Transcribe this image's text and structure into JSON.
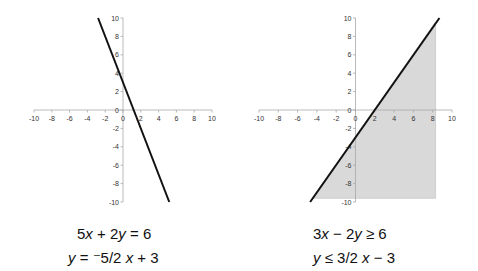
{
  "chart_data": [
    {
      "type": "line",
      "title": "",
      "xlabel": "",
      "ylabel": "",
      "xlim": [
        -10,
        10
      ],
      "ylim": [
        -10,
        10
      ],
      "x_ticks": [
        -10,
        -8,
        -6,
        -4,
        -2,
        0,
        2,
        4,
        6,
        8,
        10
      ],
      "y_ticks": [
        10,
        8,
        6,
        4,
        2,
        0,
        -2,
        -4,
        -6,
        -8,
        -10
      ],
      "grid": false,
      "legend": "none",
      "series": [
        {
          "name": "5x + 2y = 6",
          "x": [
            -2.8,
            5.2
          ],
          "y": [
            10,
            -10
          ],
          "color": "#111111"
        }
      ],
      "equation": "5x + 2y = 6",
      "slope_intercept": "y = ⁻5/2 x + 3"
    },
    {
      "type": "area",
      "title": "",
      "xlabel": "",
      "ylabel": "",
      "xlim": [
        -10,
        10
      ],
      "ylim": [
        -10,
        10
      ],
      "x_ticks": [
        -10,
        -8,
        -6,
        -4,
        -2,
        0,
        2,
        4,
        6,
        8,
        10
      ],
      "y_ticks": [
        10,
        8,
        6,
        4,
        2,
        0,
        -2,
        -4,
        -6,
        -8,
        -10
      ],
      "grid": false,
      "legend": "none",
      "series": [
        {
          "name": "boundary 3x - 2y = 6",
          "x": [
            -4.7,
            8.7
          ],
          "y": [
            -10,
            10
          ],
          "color": "#111111"
        },
        {
          "name": "shaded region y ≤ 3/2 x - 3",
          "polygon": [
            [
              -4.5,
              -9.6
            ],
            [
              8.3,
              9.6
            ],
            [
              8.3,
              -9.6
            ]
          ],
          "color": "#d9d9d9"
        }
      ],
      "equation": "3x - 2y ≥ 6",
      "slope_intercept": "y ≤ 3/2 x - 3"
    }
  ],
  "labels": {
    "left": {
      "eq1": {
        "a": "5",
        "v1": "x",
        "op1": " + 2",
        "v2": "y",
        "rest": " = 6"
      },
      "eq2": {
        "v": "y",
        "eqsign": " = ",
        "neg": "⁻",
        "frac": "5/2",
        "v2": "x",
        "rest": " + 3"
      }
    },
    "right": {
      "eq1": {
        "a": "3",
        "v1": "x",
        "op1": " − 2",
        "v2": "y",
        "rest": " ≥ 6"
      },
      "eq2": {
        "v": "y",
        "rel": " ≤ 3/2 ",
        "v2": "x",
        "rest": " − 3"
      }
    }
  },
  "colors": {
    "line": "#111111",
    "axis": "#a8a8a8",
    "shade": "#d9d9d9"
  }
}
